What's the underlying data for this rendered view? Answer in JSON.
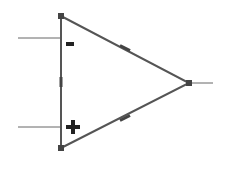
{
  "diagram": {
    "type": "op-amp-symbol",
    "colors": {
      "stroke": "#555555",
      "handle": "#444444",
      "lead": "#666666",
      "sign": "#222222",
      "background": "#ffffff"
    },
    "triangle": {
      "vertices": [
        [
          61,
          16
        ],
        [
          61,
          148
        ],
        [
          189,
          83
        ]
      ]
    },
    "inputs": [
      {
        "label": "-",
        "name": "inverting-input",
        "y": 38,
        "x_start": 18,
        "x_end": 61
      },
      {
        "label": "+",
        "name": "non-inverting-input",
        "y": 127,
        "x_start": 18,
        "x_end": 61
      }
    ],
    "output": {
      "name": "output",
      "y": 83,
      "x_start": 189,
      "x_end": 213
    },
    "signs": {
      "minus": "-",
      "plus": "+"
    }
  }
}
